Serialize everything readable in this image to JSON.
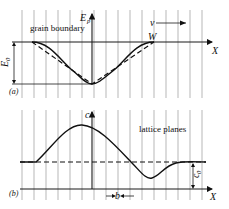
{
  "diagram": {
    "panel_a": {
      "panel_label": "(a)",
      "y_axis_label": "E",
      "y_axis_subscript": "p",
      "x_axis_label": "X",
      "region_label": "grain boundary",
      "velocity_label": "v",
      "width_label": "W",
      "depth_label": "E",
      "depth_subscript": "0",
      "curves": [
        "solid smooth well",
        "dashed triangular well"
      ]
    },
    "panel_b": {
      "panel_label": "(b)",
      "y_axis_label": "c",
      "x_axis_label": "X",
      "region_label": "lattice planes",
      "spacing_label": "b",
      "offset_label": "c",
      "offset_subscript": "0",
      "curves": [
        "solid concentration profile",
        "dashed baseline"
      ]
    },
    "colors": {
      "ink": "#111111",
      "grid": "#9a9a9a",
      "background": "#ffffff"
    }
  }
}
